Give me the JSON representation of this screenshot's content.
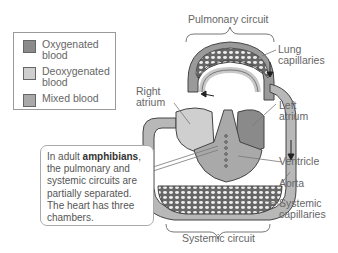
{
  "legend": {
    "items": [
      {
        "label": "Oxygenated blood",
        "line1": "Oxygenated",
        "line2": "blood",
        "color": "#8a8a8a"
      },
      {
        "label": "Deoxygenated blood",
        "line1": "Deoxygenated",
        "line2": "blood",
        "color": "#cfcfcf"
      },
      {
        "label": "Mixed blood",
        "line1": "Mixed blood",
        "line2": "",
        "color": "#a9a9a9"
      }
    ]
  },
  "labels": {
    "pulmonary_circuit": "Pulmonary circuit",
    "lung_capillaries_1": "Lung",
    "lung_capillaries_2": "capillaries",
    "right_atrium_1": "Right",
    "right_atrium_2": "atrium",
    "left_atrium_1": "Left",
    "left_atrium_2": "atrium",
    "ventricle": "Ventricle",
    "aorta": "Aorta",
    "systemic_capillaries_1": "Systemic",
    "systemic_capillaries_2": "capillaries",
    "systemic_circuit": "Systemic circuit"
  },
  "callout": {
    "prefix": "In adult ",
    "bold": "amphibians",
    "suffix": ", the pulmonary and systemic circuits are partially separated. The heart has three chambers."
  },
  "colors": {
    "oxygenated": "#8a8a8a",
    "deoxygenated": "#cfcfcf",
    "mixed": "#a9a9a9",
    "vessel_outline": "#555555"
  }
}
